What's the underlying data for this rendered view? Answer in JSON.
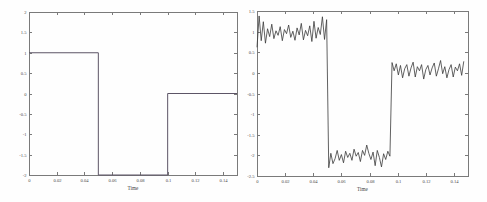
{
  "figure": {
    "background": "#fefefe",
    "panels": [
      "left",
      "right"
    ]
  },
  "chart_data": [
    {
      "type": "line",
      "title": "",
      "panel": "left",
      "name": "clean-step-signal",
      "xlabel": "Time",
      "ylabel": "",
      "xlim": [
        0,
        0.15
      ],
      "ylim": [
        -2,
        2
      ],
      "xticks": [
        0,
        0.02,
        0.04,
        0.06,
        0.08,
        0.1,
        0.12,
        0.14
      ],
      "xticklabels": [
        "0",
        "0.02",
        "0.04",
        "0.06",
        "0.08",
        "0.1",
        "0.12",
        "0.14"
      ],
      "yticks": [
        -2,
        -1.5,
        -1,
        -0.5,
        0,
        0.5,
        1,
        1.5,
        2
      ],
      "yticklabels": [
        "-2",
        "-1.5",
        "-1",
        "-0.5",
        "0",
        "0.5",
        "1",
        "1.5",
        "2"
      ],
      "grid": false,
      "legend": false,
      "line_color": "#5d5566",
      "series": [
        {
          "name": "clean signal",
          "description": "piecewise-constant 3-level step: 1 for t<0.05, -2 for 0.05<=t<0.1, 0 for t>=0.1",
          "x": [
            0,
            0.05,
            0.05,
            0.1,
            0.1,
            0.15
          ],
          "y": [
            1,
            1,
            -2,
            -2,
            0,
            0
          ]
        }
      ]
    },
    {
      "type": "line",
      "title": "",
      "panel": "right",
      "name": "noisy-step-signal",
      "xlabel": "Time",
      "ylabel": "",
      "xlim": [
        0,
        0.15
      ],
      "ylim": [
        -2.5,
        1.5
      ],
      "xticks": [
        0,
        0.02,
        0.04,
        0.06,
        0.08,
        0.1,
        0.12,
        0.14
      ],
      "xticklabels": [
        "0",
        "0.02",
        "0.04",
        "0.06",
        "0.08",
        "0.1",
        "0.12",
        "0.14"
      ],
      "yticks": [
        -2.5,
        -2,
        -1.5,
        -1,
        -0.5,
        0,
        0.5,
        1,
        1.5
      ],
      "yticklabels": [
        "-2.5",
        "-2",
        "-1.5",
        "-1",
        "-0.5",
        "0",
        "0.5",
        "1",
        "1.5"
      ],
      "grid": false,
      "legend": false,
      "line_color": "#3a3a3a",
      "series": [
        {
          "name": "noisy signal",
          "description": "same 3-level step signal with additive random noise, amplitude approx +/-0.3",
          "x": [
            0,
            0.0015,
            0.003,
            0.0045,
            0.006,
            0.0075,
            0.009,
            0.0105,
            0.012,
            0.0135,
            0.015,
            0.0165,
            0.018,
            0.0195,
            0.021,
            0.0225,
            0.024,
            0.0255,
            0.027,
            0.0285,
            0.03,
            0.0315,
            0.033,
            0.0345,
            0.036,
            0.0375,
            0.039,
            0.0405,
            0.042,
            0.0435,
            0.045,
            0.0465,
            0.048,
            0.0495,
            0.051,
            0.0525,
            0.054,
            0.0555,
            0.057,
            0.0585,
            0.06,
            0.0615,
            0.063,
            0.0645,
            0.066,
            0.0675,
            0.069,
            0.0705,
            0.072,
            0.0735,
            0.075,
            0.0765,
            0.078,
            0.0795,
            0.081,
            0.0825,
            0.084,
            0.0855,
            0.087,
            0.0885,
            0.09,
            0.0915,
            0.093,
            0.0945,
            0.096,
            0.0975,
            0.099,
            0.1005,
            0.102,
            0.1035,
            0.105,
            0.1065,
            0.108,
            0.1095,
            0.111,
            0.1125,
            0.114,
            0.1155,
            0.117,
            0.1185,
            0.12,
            0.1215,
            0.123,
            0.1245,
            0.126,
            0.1275,
            0.129,
            0.1305,
            0.132,
            0.1335,
            0.135,
            0.1365,
            0.138,
            0.1395,
            0.141,
            0.1425,
            0.144,
            0.1455,
            0.147,
            0.1485,
            0.15
          ],
          "y": [
            0.62,
            1.38,
            0.78,
            1.24,
            0.72,
            1.07,
            0.88,
            1.18,
            0.83,
            1.02,
            0.91,
            1.12,
            0.78,
            1.05,
            0.95,
            1.16,
            0.86,
            1.01,
            0.79,
            1.09,
            0.92,
            1.2,
            0.8,
            1.03,
            0.9,
            1.14,
            0.76,
            1.25,
            0.84,
            1.1,
            0.93,
            1.36,
            0.81,
            1.29,
            -2.3,
            -1.95,
            -2.2,
            -2.08,
            -1.88,
            -2.12,
            -1.98,
            -2.18,
            -1.9,
            -2.05,
            -1.95,
            -2.12,
            -1.85,
            -2.02,
            -1.93,
            -2.15,
            -1.88,
            -2.0,
            -1.75,
            -1.95,
            -2.1,
            -1.92,
            -2.25,
            -1.88,
            -2.05,
            -2.28,
            -1.96,
            -2.1,
            -1.9,
            -2.02,
            0.25,
            0.05,
            0.22,
            -0.05,
            0.18,
            -0.12,
            0.1,
            0.2,
            -0.08,
            0.12,
            0.26,
            -0.1,
            0.15,
            0.05,
            0.2,
            -0.15,
            0.08,
            0.18,
            -0.05,
            0.12,
            0.24,
            -0.08,
            0.1,
            0.3,
            -0.02,
            0.15,
            -0.12,
            0.08,
            0.2,
            -0.1,
            0.14,
            0.05,
            0.22,
            -0.06,
            0.28
          ]
        }
      ]
    }
  ]
}
